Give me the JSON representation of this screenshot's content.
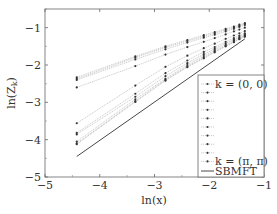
{
  "chart_data": {
    "type": "line",
    "title": "",
    "xlabel": "ln(x)",
    "ylabel": "ln(Z_k)",
    "xlim": [
      -5,
      -1
    ],
    "ylim": [
      -5,
      -0.5
    ],
    "xticks": [
      -5,
      -4,
      -3,
      -2,
      -1
    ],
    "yticks": [
      -5,
      -4,
      -3,
      -2,
      -1
    ],
    "xtick_labels": [
      "−5",
      "−4",
      "−3",
      "−2",
      "−1"
    ],
    "ytick_labels": [
      "−5",
      "−4",
      "−3",
      "−2",
      "−1"
    ],
    "grid": false,
    "legend_position": "lower right",
    "x": [
      -4.42,
      -3.35,
      -2.8,
      -2.4,
      -2.1,
      -1.9,
      -1.7,
      -1.55,
      -1.45,
      -1.35
    ],
    "series": [
      {
        "name": "k = (0,0)",
        "style": "dotted-marker",
        "values": [
          -2.33,
          -1.77,
          -1.5,
          -1.33,
          -1.2,
          -1.12,
          -1.03,
          -0.97,
          -0.92,
          -0.88
        ]
      },
      {
        "name": "k2",
        "style": "dotted-marker",
        "values": [
          -2.37,
          -1.8,
          -1.53,
          -1.36,
          -1.23,
          -1.15,
          -1.06,
          -1.0,
          -0.95,
          -0.9
        ]
      },
      {
        "name": "k3",
        "style": "dotted-marker",
        "values": [
          -2.4,
          -1.85,
          -1.58,
          -1.4,
          -1.27,
          -1.19,
          -1.1,
          -1.03,
          -0.98,
          -0.93
        ]
      },
      {
        "name": "k4",
        "style": "dotted-marker",
        "values": [
          -2.6,
          -2.03,
          -1.72,
          -1.52,
          -1.38,
          -1.28,
          -1.18,
          -1.1,
          -1.05,
          -1.0
        ]
      },
      {
        "name": "k5",
        "style": "dotted-marker",
        "values": [
          -3.56,
          -2.55,
          -2.05,
          -1.75,
          -1.55,
          -1.43,
          -1.3,
          -1.21,
          -1.15,
          -1.09
        ]
      },
      {
        "name": "k6",
        "style": "dotted-marker",
        "values": [
          -3.82,
          -2.77,
          -2.22,
          -1.88,
          -1.65,
          -1.52,
          -1.38,
          -1.28,
          -1.21,
          -1.15
        ]
      },
      {
        "name": "k7",
        "style": "dotted-marker",
        "values": [
          -3.86,
          -2.85,
          -2.3,
          -1.95,
          -1.71,
          -1.57,
          -1.42,
          -1.32,
          -1.25,
          -1.18
        ]
      },
      {
        "name": "k8",
        "style": "dotted-marker",
        "values": [
          -4.05,
          -2.92,
          -2.37,
          -2.0,
          -1.76,
          -1.61,
          -1.46,
          -1.35,
          -1.28,
          -1.21
        ]
      },
      {
        "name": "k9",
        "style": "dotted-marker",
        "values": [
          -4.1,
          -2.97,
          -2.4,
          -2.04,
          -1.8,
          -1.64,
          -1.49,
          -1.38,
          -1.3,
          -1.23
        ]
      },
      {
        "name": "k = (π,π)",
        "style": "dotted-marker",
        "values": [
          -4.12,
          -2.99,
          -2.42,
          -2.06,
          -1.82,
          -1.66,
          -1.5,
          -1.39,
          -1.31,
          -1.24
        ]
      }
    ],
    "reference_line": {
      "name": "SBMFT",
      "style": "solid",
      "x": [
        -4.42,
        -1.35
      ],
      "y": [
        -4.45,
        -1.3
      ]
    },
    "legend": {
      "entries": [
        "k = (0,0)",
        "",
        "",
        "",
        "",
        "",
        "",
        "",
        "",
        "k = (π,π)",
        "SBMFT"
      ]
    }
  },
  "labels": {
    "xlabel": "ln(x)",
    "ylabel": "ln(Z",
    "ylabel_sub": "k",
    "legend_first": "k = (0, 0)",
    "legend_last": "k = (π, π)",
    "legend_sbmft": "SBMFT"
  }
}
